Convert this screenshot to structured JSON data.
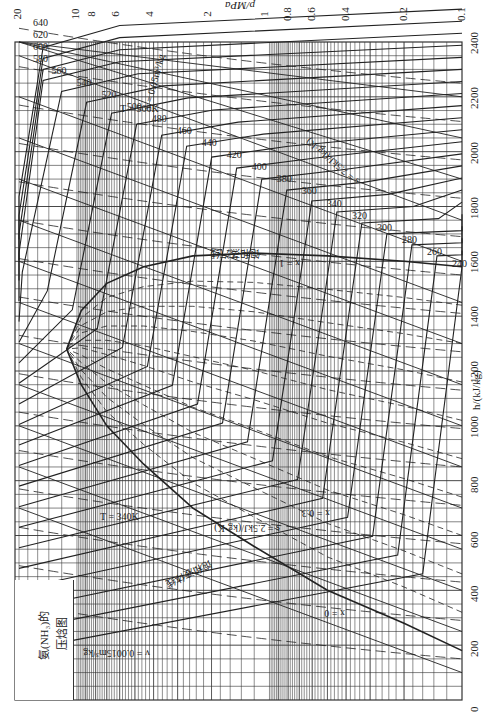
{
  "chart_data": {
    "type": "line",
    "title_lines": [
      "氨(NH₃)的",
      "压焓图"
    ],
    "orientation": "rotated 90°: pressure axis on top (decreasing left→right), enthalpy axis on right (increasing bottom→top)",
    "xlabel": "h/(kJ/kg)",
    "ylabel": "p/MPa",
    "x_axis": {
      "label": "h/(kJ/kg)",
      "scale": "linear",
      "range": [
        0,
        2400
      ],
      "ticks": [
        0,
        200,
        400,
        600,
        800,
        1000,
        1200,
        1400,
        1600,
        1800,
        2000,
        2200,
        2400
      ]
    },
    "y_axis": {
      "label": "p/MPa",
      "scale": "log",
      "range": [
        0.1,
        20
      ],
      "ticks": [
        20,
        10,
        8,
        6,
        4,
        2,
        1,
        0.8,
        0.6,
        0.4,
        0.2,
        0.1
      ]
    },
    "grid": true,
    "isotherms_K": [
      240,
      260,
      280,
      300,
      320,
      340,
      360,
      380,
      400,
      420,
      440,
      460,
      480,
      500,
      520,
      540,
      560,
      580,
      600,
      620,
      640
    ],
    "isentropes_kJ_per_kgK": [
      1.5,
      2,
      2.5,
      3,
      3.5,
      4,
      4.5,
      5,
      5.5,
      6,
      6.5,
      7,
      7.5,
      8,
      8.5
    ],
    "quality_lines": [
      0,
      0.1,
      0.2,
      0.3,
      0.4,
      0.5,
      0.6,
      0.7,
      0.8,
      0.9,
      1
    ],
    "isochores_m3_per_kg": [
      0.0015,
      0.0017,
      0.002,
      0.003,
      0.005,
      0.007,
      0.01,
      0.014,
      0.02,
      0.03,
      0.05,
      0.07,
      0.1,
      0.14,
      0.2,
      0.3
    ],
    "annotations": [
      "T = 340K",
      "T = 560K",
      "s = 2.5kJ/(kg·K)",
      "s = 7.5kJ/(kg·K)",
      "v = 0.0015m³/kg",
      "v = 0.05m³/kg",
      "x = 0",
      "x = 0.3",
      "x = 1",
      "饱和液体线",
      "饱和蒸汽线"
    ],
    "saturation_dome": {
      "critical_point": {
        "h": 1280,
        "p": 11.3
      },
      "saturated_liquid": [
        [
          180,
          0.1
        ],
        [
          280,
          0.2
        ],
        [
          400,
          0.5
        ],
        [
          560,
          1.2
        ],
        [
          700,
          2.5
        ],
        [
          860,
          4.5
        ],
        [
          1000,
          7
        ],
        [
          1150,
          9.5
        ],
        [
          1280,
          11.3
        ]
      ],
      "saturated_vapor": [
        [
          1580,
          0.1
        ],
        [
          1600,
          0.2
        ],
        [
          1620,
          0.5
        ],
        [
          1630,
          1.2
        ],
        [
          1620,
          2.5
        ],
        [
          1580,
          4.5
        ],
        [
          1520,
          7
        ],
        [
          1420,
          9.5
        ],
        [
          1280,
          11.3
        ]
      ]
    }
  },
  "labels": {
    "p_axis_title": "p/MPa",
    "h_axis_title": "h/(kJ/kg)",
    "p_ticks": [
      "20",
      "10",
      "8",
      "6",
      "4",
      "2",
      "1",
      "0.8",
      "0.6",
      "0.4",
      "0.2",
      "0.1"
    ],
    "h_ticks": [
      "0",
      "200",
      "400",
      "600",
      "800",
      "1000",
      "1200",
      "1400",
      "1600",
      "1800",
      "2000",
      "2200",
      "2400"
    ],
    "title_line1": "氨(NH₃)的",
    "title_line2": "压焓图",
    "sat_liquid": "饱和液体线",
    "sat_vapor": "饱和蒸汽线",
    "t340": "T = 340K",
    "t560": "T = 560K",
    "s25": "s = 2.5kJ/(kg·K)",
    "s75": "s = 7.5kJ/(kg·K)",
    "v0015": "v = 0.0015m³/kg",
    "v005": "v = 0.05m³/kg",
    "x0": "x = 0",
    "x1": "x = 1",
    "x03": "x = 0.3"
  },
  "colors": {
    "line": "#222222",
    "grid": "#333333",
    "background": "#ffffff"
  }
}
